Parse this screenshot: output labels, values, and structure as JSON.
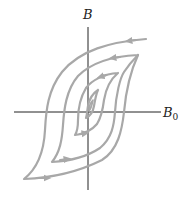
{
  "diagram": {
    "type": "hysteresis-loops",
    "axes": {
      "vertical_label": "B",
      "horizontal_label_base": "B",
      "horizontal_label_sub": "0"
    },
    "loop_count": 4,
    "colors": {
      "axis": "#222222",
      "curve": "#a8a8a8",
      "background": "#ffffff"
    }
  }
}
